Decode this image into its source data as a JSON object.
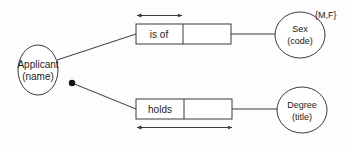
{
  "diagram": {
    "entities": [
      {
        "id": "applicant",
        "name": "Applicant",
        "key": "(name)"
      },
      {
        "id": "sex",
        "name": "Sex",
        "key": "(code)",
        "annotation": "{M,F}"
      },
      {
        "id": "degree",
        "name": "Degree",
        "key": "(title)"
      }
    ],
    "relationships": [
      {
        "id": "is-of",
        "label": "is of",
        "from": "applicant",
        "to": "sex"
      },
      {
        "id": "holds",
        "label": "holds",
        "from": "applicant",
        "to": "degree"
      }
    ],
    "colors": {
      "stroke": "#3a3a3a",
      "fill": "#ffffff",
      "background": "#fdfdfd",
      "dot": "#111111"
    }
  }
}
